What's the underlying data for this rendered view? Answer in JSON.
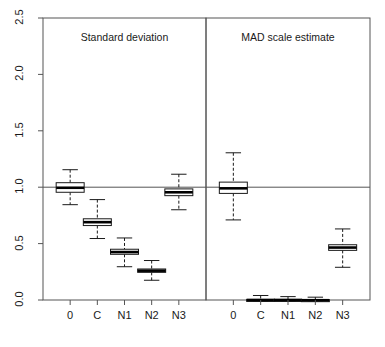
{
  "chart_data": {
    "type": "box",
    "title": "",
    "xlabel": "",
    "ylabel": "",
    "ylim": [
      0.0,
      2.5
    ],
    "yticks": [
      0.0,
      0.5,
      1.0,
      1.5,
      2.0,
      2.5
    ],
    "ytick_labels": [
      "0.0",
      "0.5",
      "1.0",
      "1.5",
      "2.0",
      "2.5"
    ],
    "grid": false,
    "legend": "none",
    "reference_line": {
      "y": 1.0,
      "style": "solid",
      "color": "#555555"
    },
    "panels": [
      {
        "title": "Standard deviation",
        "categories": [
          "0",
          "C",
          "N1",
          "N2",
          "N3"
        ],
        "boxes": [
          {
            "label": "0",
            "lower_whisker": 0.845,
            "q1": 0.955,
            "median": 0.995,
            "q3": 1.04,
            "upper_whisker": 1.155
          },
          {
            "label": "C",
            "lower_whisker": 0.545,
            "q1": 0.66,
            "median": 0.69,
            "q3": 0.72,
            "upper_whisker": 0.89
          },
          {
            "label": "N1",
            "lower_whisker": 0.295,
            "q1": 0.405,
            "median": 0.425,
            "q3": 0.45,
            "upper_whisker": 0.55
          },
          {
            "label": "N2",
            "lower_whisker": 0.175,
            "q1": 0.245,
            "median": 0.26,
            "q3": 0.275,
            "upper_whisker": 0.35
          },
          {
            "label": "N3",
            "lower_whisker": 0.8,
            "q1": 0.925,
            "median": 0.955,
            "q3": 0.985,
            "upper_whisker": 1.115
          }
        ]
      },
      {
        "title": "MAD scale estimate",
        "categories": [
          "0",
          "C",
          "N1",
          "N2",
          "N3"
        ],
        "boxes": [
          {
            "label": "0",
            "lower_whisker": 0.71,
            "q1": 0.945,
            "median": 0.99,
            "q3": 1.045,
            "upper_whisker": 1.305
          },
          {
            "label": "C",
            "lower_whisker": -0.01,
            "q1": -0.005,
            "median": 0.0,
            "q3": 0.005,
            "upper_whisker": 0.04
          },
          {
            "label": "N1",
            "lower_whisker": -0.01,
            "q1": -0.005,
            "median": 0.0,
            "q3": 0.005,
            "upper_whisker": 0.03
          },
          {
            "label": "N2",
            "lower_whisker": -0.01,
            "q1": -0.005,
            "median": -0.002,
            "q3": 0.003,
            "upper_whisker": 0.025
          },
          {
            "label": "N3",
            "lower_whisker": 0.29,
            "q1": 0.44,
            "median": 0.465,
            "q3": 0.49,
            "upper_whisker": 0.63
          }
        ]
      }
    ]
  },
  "axis": {
    "y_tick_labels": [
      "0.0",
      "0.5",
      "1.0",
      "1.5",
      "2.0",
      "2.5"
    ],
    "x_tick_labels_left": [
      "0",
      "C",
      "N1",
      "N2",
      "N3"
    ],
    "x_tick_labels_right": [
      "0",
      "C",
      "N1",
      "N2",
      "N3"
    ]
  },
  "panel_titles": {
    "left": "Standard deviation",
    "right": "MAD scale estimate"
  },
  "colors": {
    "axis": "#555555",
    "box_stroke": "#1a1a1a",
    "median": "#000000",
    "background": "#ffffff",
    "text": "#1a1a1a"
  }
}
